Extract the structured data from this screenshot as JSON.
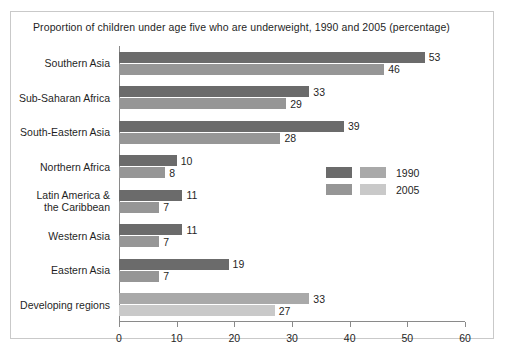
{
  "chart_data": {
    "type": "bar",
    "orientation": "horizontal",
    "title": "Proportion of children under age five who are underweight, 1990 and 2005 (percentage)",
    "xlabel": "",
    "ylabel": "",
    "xlim": [
      0,
      60
    ],
    "xticks": [
      0,
      10,
      20,
      30,
      40,
      50,
      60
    ],
    "xtick_labels": [
      "0",
      "10",
      "20",
      "30",
      "40",
      "50",
      "60"
    ],
    "grid": false,
    "legend_position": "center-right",
    "categories": [
      "Southern Asia",
      "Sub-Saharan Africa",
      "South-Eastern Asia",
      "Northern Africa",
      "Latin America &\nthe Caribbean",
      "Western Asia",
      "Eastern Asia",
      "Developing regions"
    ],
    "series": [
      {
        "name": "1990",
        "values": [
          53,
          33,
          39,
          10,
          11,
          11,
          19,
          33
        ],
        "color": "#6b6b6b",
        "color_alt": "#a9a9a9"
      },
      {
        "name": "2005",
        "values": [
          46,
          29,
          28,
          8,
          7,
          7,
          7,
          27
        ],
        "color": "#969696",
        "color_alt": "#c9c9c9"
      }
    ]
  },
  "rows": [
    {
      "label": "Southern Asia",
      "v1990": 53,
      "v2005": 46,
      "c1990": "#6b6b6b",
      "c2005": "#969696"
    },
    {
      "label": "Sub-Saharan Africa",
      "v1990": 33,
      "v2005": 29,
      "c1990": "#6b6b6b",
      "c2005": "#969696"
    },
    {
      "label": "South-Eastern Asia",
      "v1990": 39,
      "v2005": 28,
      "c1990": "#6b6b6b",
      "c2005": "#969696"
    },
    {
      "label": "Northern Africa",
      "v1990": 10,
      "v2005": 8,
      "c1990": "#6b6b6b",
      "c2005": "#969696"
    },
    {
      "label": "Latin America &\nthe Caribbean",
      "v1990": 11,
      "v2005": 7,
      "c1990": "#6b6b6b",
      "c2005": "#969696"
    },
    {
      "label": "Western Asia",
      "v1990": 11,
      "v2005": 7,
      "c1990": "#6b6b6b",
      "c2005": "#969696"
    },
    {
      "label": "Eastern Asia",
      "v1990": 19,
      "v2005": 7,
      "c1990": "#6b6b6b",
      "c2005": "#969696"
    },
    {
      "label": "Developing regions",
      "v1990": 33,
      "v2005": 27,
      "c1990": "#a9a9a9",
      "c2005": "#c9c9c9"
    }
  ],
  "legend": {
    "entries": [
      {
        "label": "1990",
        "swatch_dark": "#6b6b6b",
        "swatch_light": "#a9a9a9"
      },
      {
        "label": "2005",
        "swatch_dark": "#969696",
        "swatch_light": "#c9c9c9"
      }
    ]
  },
  "axis": {
    "tick_labels": [
      "0",
      "10",
      "20",
      "30",
      "40",
      "50",
      "60"
    ]
  }
}
